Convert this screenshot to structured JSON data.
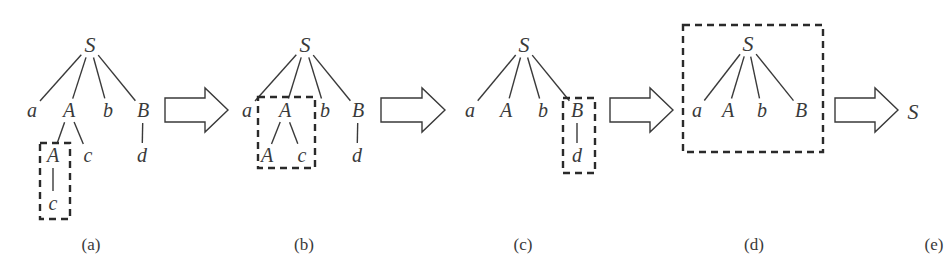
{
  "figure": {
    "panels": [
      {
        "caption": "(a)",
        "caption_pos": [
          91,
          244
        ],
        "nodes": [
          {
            "id": "S",
            "label": "S",
            "x": 90,
            "y": 45,
            "root": true
          },
          {
            "id": "a",
            "label": "a",
            "x": 32,
            "y": 110
          },
          {
            "id": "A1",
            "label": "A",
            "x": 69,
            "y": 110
          },
          {
            "id": "b",
            "label": "b",
            "x": 108,
            "y": 110
          },
          {
            "id": "B",
            "label": "B",
            "x": 143,
            "y": 110
          },
          {
            "id": "A2",
            "label": "A",
            "x": 53,
            "y": 155
          },
          {
            "id": "c1",
            "label": "c",
            "x": 88,
            "y": 155
          },
          {
            "id": "d",
            "label": "d",
            "x": 142,
            "y": 155
          },
          {
            "id": "c2",
            "label": "c",
            "x": 53,
            "y": 203
          }
        ],
        "edges": [
          [
            "S",
            "a"
          ],
          [
            "S",
            "A1"
          ],
          [
            "S",
            "b"
          ],
          [
            "S",
            "B"
          ],
          [
            "A1",
            "A2"
          ],
          [
            "A1",
            "c1"
          ],
          [
            "B",
            "d"
          ],
          [
            "A2",
            "c2"
          ]
        ],
        "highlight_box": {
          "x": 40,
          "y": 143,
          "w": 30,
          "h": 76,
          "label": "A -> c"
        }
      },
      {
        "caption": "(b)",
        "caption_pos": [
          304,
          244
        ],
        "nodes": [
          {
            "id": "S",
            "label": "S",
            "x": 305,
            "y": 45,
            "root": true
          },
          {
            "id": "a",
            "label": "a",
            "x": 247,
            "y": 110
          },
          {
            "id": "A1",
            "label": "A",
            "x": 285,
            "y": 110
          },
          {
            "id": "b",
            "label": "b",
            "x": 325,
            "y": 110
          },
          {
            "id": "B",
            "label": "B",
            "x": 358,
            "y": 110
          },
          {
            "id": "A2",
            "label": "A",
            "x": 267,
            "y": 155
          },
          {
            "id": "c1",
            "label": "c",
            "x": 302,
            "y": 155
          },
          {
            "id": "d",
            "label": "d",
            "x": 357,
            "y": 155
          }
        ],
        "edges": [
          [
            "S",
            "a"
          ],
          [
            "S",
            "A1"
          ],
          [
            "S",
            "b"
          ],
          [
            "S",
            "B"
          ],
          [
            "A1",
            "A2"
          ],
          [
            "A1",
            "c1"
          ],
          [
            "B",
            "d"
          ]
        ],
        "highlight_box": {
          "x": 258,
          "y": 97,
          "w": 57,
          "h": 71,
          "label": "A -> A c"
        }
      },
      {
        "caption": "(c)",
        "caption_pos": [
          523,
          244
        ],
        "nodes": [
          {
            "id": "S",
            "label": "S",
            "x": 524,
            "y": 45,
            "root": true
          },
          {
            "id": "a",
            "label": "a",
            "x": 470,
            "y": 110
          },
          {
            "id": "A1",
            "label": "A",
            "x": 506,
            "y": 110
          },
          {
            "id": "b",
            "label": "b",
            "x": 543,
            "y": 110
          },
          {
            "id": "B",
            "label": "B",
            "x": 577,
            "y": 110
          },
          {
            "id": "d",
            "label": "d",
            "x": 577,
            "y": 155
          }
        ],
        "edges": [
          [
            "S",
            "a"
          ],
          [
            "S",
            "A1"
          ],
          [
            "S",
            "b"
          ],
          [
            "S",
            "B"
          ],
          [
            "B",
            "d"
          ]
        ],
        "highlight_box": {
          "x": 563,
          "y": 98,
          "w": 32,
          "h": 75,
          "label": "B -> d"
        }
      },
      {
        "caption": "(d)",
        "caption_pos": [
          754,
          244
        ],
        "nodes": [
          {
            "id": "S",
            "label": "S",
            "x": 748,
            "y": 44,
            "root": true
          },
          {
            "id": "a",
            "label": "a",
            "x": 697,
            "y": 110
          },
          {
            "id": "A1",
            "label": "A",
            "x": 728,
            "y": 110
          },
          {
            "id": "b",
            "label": "b",
            "x": 762,
            "y": 110
          },
          {
            "id": "B",
            "label": "B",
            "x": 801,
            "y": 110
          }
        ],
        "edges": [
          [
            "S",
            "a"
          ],
          [
            "S",
            "A1"
          ],
          [
            "S",
            "b"
          ],
          [
            "S",
            "B"
          ]
        ],
        "highlight_box": {
          "x": 683,
          "y": 25,
          "w": 140,
          "h": 127,
          "label": "S -> a A b B"
        }
      },
      {
        "caption": "(e)",
        "caption_pos": [
          934,
          244
        ],
        "nodes": [
          {
            "id": "S",
            "label": "S",
            "x": 913,
            "y": 112,
            "root": true
          }
        ],
        "edges": [],
        "highlight_box": null
      }
    ],
    "arrows": [
      {
        "from": "(a)",
        "to": "(b)",
        "x0": 165,
        "x1": 228,
        "y": 110
      },
      {
        "from": "(b)",
        "to": "(c)",
        "x0": 381,
        "x1": 445,
        "y": 110
      },
      {
        "from": "(c)",
        "to": "(d)",
        "x0": 610,
        "x1": 673,
        "y": 110
      },
      {
        "from": "(d)",
        "to": "(e)",
        "x0": 835,
        "x1": 898,
        "y": 110
      }
    ],
    "colors": {
      "ink": "#3a3a3a",
      "box": "#2a2a2a",
      "background": "#ffffff"
    }
  }
}
